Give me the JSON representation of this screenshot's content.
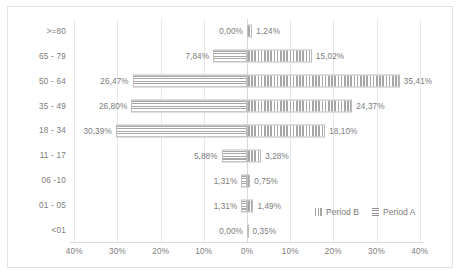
{
  "chart_data": {
    "type": "bar",
    "subtype": "population-pyramid",
    "title": "",
    "xlabel": "",
    "ylabel": "",
    "orientation": "horizontal",
    "grid": true,
    "legend_position": "inside-bottom-right",
    "categories": [
      "<01",
      "01 - 05",
      "06 -10",
      "11 - 17",
      "18 - 34",
      "35 - 49",
      "50 - 64",
      "65 - 79",
      ">=80"
    ],
    "categories_top_to_bottom": [
      ">=80",
      "65 - 79",
      "50 - 64",
      "35 - 49",
      "18 - 34",
      "11 - 17",
      "06 -10",
      "01 - 05",
      "<01"
    ],
    "xlim": [
      -41,
      41
    ],
    "xticks": [
      -40,
      -30,
      -20,
      -10,
      0,
      10,
      20,
      30,
      40
    ],
    "xtick_labels": [
      "40%",
      "30%",
      "20%",
      "10%",
      "0%",
      "10%",
      "20%",
      "30%",
      "40%"
    ],
    "series": [
      {
        "name": "Period A",
        "side": "left",
        "pattern": "horizontal-stripes",
        "color": "#a6a6a6",
        "values": [
          0.0,
          1.31,
          1.31,
          5.88,
          30.39,
          26.8,
          26.47,
          7.84,
          0.0
        ],
        "labels": [
          "0,00%",
          "1,31%",
          "1,31%",
          "5,88%",
          "30,39%",
          "26,80%",
          "26,47%",
          "7,84%",
          "0,00%"
        ]
      },
      {
        "name": "Period B",
        "side": "right",
        "pattern": "vertical-stripes",
        "color": "#a6a6a6",
        "values": [
          0.35,
          1.49,
          0.75,
          3.28,
          18.1,
          24.37,
          35.41,
          15.02,
          1.24
        ],
        "labels": [
          "0,35%",
          "1,49%",
          "0,75%",
          "3,28%",
          "18,10%",
          "24,37%",
          "35,41%",
          "15,02%",
          "1,24%"
        ]
      }
    ]
  },
  "legend": {
    "items": [
      {
        "label": "Period B"
      },
      {
        "label": "Period A"
      }
    ]
  }
}
